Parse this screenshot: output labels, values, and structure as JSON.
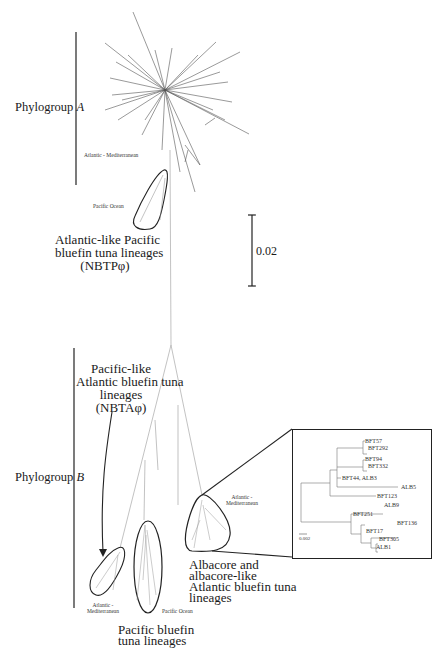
{
  "figure": {
    "type": "unrooted phylogenetic tree",
    "groups": [
      {
        "id": "A",
        "label_prefix": "Phylogroup ",
        "label_italic": "A"
      },
      {
        "id": "B",
        "label_prefix": "Phylogroup ",
        "label_italic": "B"
      }
    ],
    "scale_bar": {
      "value": "0.02"
    },
    "phylogroup_a": {
      "region_atlantic": "Atlantic - Mediterranean",
      "region_pacific": "Pacific Ocean",
      "lineage_label": [
        "Atlantic-like Pacific",
        "bluefin tuna lineages",
        "(NBTPφ)"
      ]
    },
    "phylogroup_b": {
      "lineage_nbta": [
        "Pacific-like",
        "Atlantic bluefin tuna",
        "lineages",
        "(NBTAφ)"
      ],
      "region_atlantic_left": [
        "Atlantic -",
        "Mediterranean"
      ],
      "region_pacific": "Pacific Ocean",
      "lineage_pacific": [
        "Pacific bluefin",
        "tuna lineages"
      ],
      "region_atlantic_right": [
        "Atlantic -",
        "Mediterranean"
      ],
      "lineage_albacore": [
        "Albacore and",
        "albacore-like",
        "Atlantic bluefin tuna",
        "lineages"
      ]
    },
    "inset": {
      "scale_bar": "0.002",
      "taxa": [
        "BFT57",
        "BFT292",
        "BFT94",
        "BFT332",
        "BFT44, ALB3",
        "ALB5",
        "BFT123",
        "ALB9",
        "BFT251",
        "BFT136",
        "BFT17",
        "BFT305",
        "ALB1"
      ]
    }
  }
}
